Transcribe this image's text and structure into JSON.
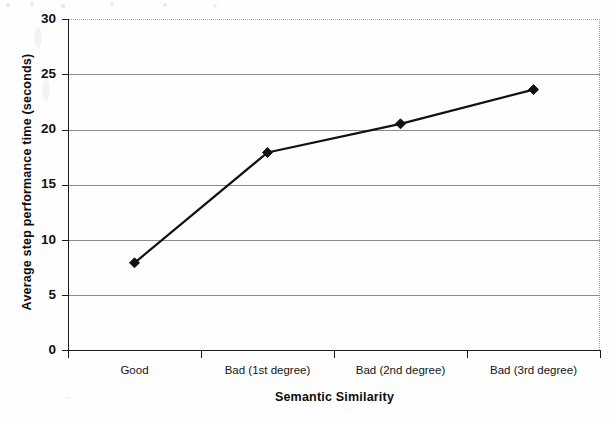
{
  "chart_data": {
    "type": "line",
    "title": "",
    "subtitle": "",
    "xlabel": "Semantic Similarity",
    "ylabel": "Average step performance time (seconds)",
    "categories": [
      "Good",
      "Bad (1st degree)",
      "Bad (2nd degree)",
      "Bad (3rd degree)"
    ],
    "values": [
      7.9,
      17.9,
      20.5,
      23.6
    ],
    "series": [
      {
        "name": "Average step performance time",
        "values": [
          7.9,
          17.9,
          20.5,
          23.6
        ]
      }
    ],
    "ylim": [
      0,
      30
    ],
    "y_ticks": [
      0,
      5,
      10,
      15,
      20,
      25,
      30
    ],
    "y_tick_labels": [
      "0",
      "5",
      "10",
      "15",
      "20",
      "25",
      "30"
    ],
    "grid": true,
    "grid_axis": "y",
    "legend": false,
    "legend_position": "none",
    "marker": "diamond",
    "marker_color": "#111111",
    "line_color": "#111111",
    "line_width": 2.2,
    "plot_background": "#ffffff",
    "annotations": []
  },
  "axis": {
    "y_title": "Average step performance time (seconds)",
    "x_title": "Semantic Similarity",
    "y_tick_labels": [
      "30",
      "25",
      "20",
      "15",
      "10",
      "5",
      "0"
    ],
    "x_tick_labels": [
      "Good",
      "Bad (1st degree)",
      "Bad (2nd degree)",
      "Bad (3rd degree)"
    ]
  },
  "colors": {
    "axis_line": "#1a1a1a",
    "gridline": "#8a8a8a",
    "plot_border_dotted": "#a8a8a8",
    "text": "#101010",
    "background": "#ffffff"
  }
}
